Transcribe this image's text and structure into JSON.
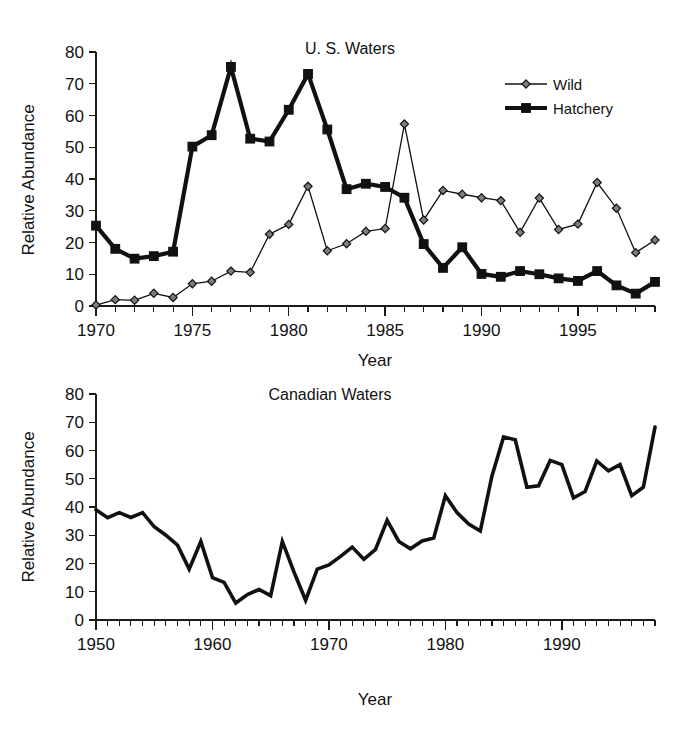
{
  "figure": {
    "panels": [
      "us-waters",
      "canadian-waters"
    ]
  },
  "chart_data": [
    {
      "id": "us-waters",
      "type": "line",
      "title": "U. S. Waters",
      "xlabel": "Year",
      "ylabel": "Relative Abundance",
      "xlim": [
        1970,
        1999
      ],
      "ylim": [
        0,
        80
      ],
      "yticks": [
        0,
        10,
        20,
        30,
        40,
        50,
        60,
        70,
        80
      ],
      "ytick_labels": [
        "0",
        "10",
        "20",
        "30",
        "40",
        "50",
        "60",
        "70",
        "80"
      ],
      "xticks": [
        1970,
        1975,
        1980,
        1985,
        1990,
        1995
      ],
      "xtick_labels": [
        "1970",
        "1975",
        "1980",
        "1985",
        "1990",
        "1995"
      ],
      "xtick_minor_step": 1,
      "grid": false,
      "legend_position": "top-right",
      "x": [
        1970,
        1971,
        1972,
        1973,
        1974,
        1975,
        1976,
        1977,
        1978,
        1979,
        1980,
        1981,
        1982,
        1983,
        1984,
        1985,
        1986,
        1987,
        1988,
        1989,
        1990,
        1991,
        1992,
        1993,
        1994,
        1995,
        1996,
        1997,
        1998,
        1999
      ],
      "series": [
        {
          "name": "Wild",
          "marker": "diamond",
          "color": "#111111",
          "values": [
            0.3,
            2.0,
            1.8,
            4.0,
            2.7,
            7.0,
            7.8,
            11.0,
            10.6,
            22.6,
            25.7,
            37.7,
            17.4,
            19.6,
            23.5,
            24.4,
            57.3,
            27.1,
            36.4,
            35.2,
            34.1,
            33.2,
            23.2,
            34.0,
            24.1,
            25.8,
            38.9,
            30.8,
            16.8,
            20.8
          ]
        },
        {
          "name": "Hatchery",
          "marker": "square",
          "color": "#111111",
          "values": [
            25.3,
            18.0,
            14.9,
            15.7,
            17.1,
            50.2,
            53.8,
            75.3,
            52.7,
            51.8,
            61.8,
            73.1,
            55.6,
            36.8,
            38.5,
            37.5,
            34.1,
            19.5,
            12.0,
            18.5,
            10.1,
            9.2,
            11.0,
            10.0,
            8.7,
            7.9,
            11.0,
            6.5,
            3.9,
            7.6
          ]
        }
      ]
    },
    {
      "id": "canadian-waters",
      "type": "line",
      "title": "Canadian Waters",
      "xlabel": "Year",
      "ylabel": "Relative Abundance",
      "xlim": [
        1950,
        1998
      ],
      "ylim": [
        0,
        80
      ],
      "yticks": [
        0,
        10,
        20,
        30,
        40,
        50,
        60,
        70,
        80
      ],
      "ytick_labels": [
        "0",
        "10",
        "20",
        "30",
        "40",
        "50",
        "60",
        "70",
        "80"
      ],
      "xticks": [
        1950,
        1960,
        1970,
        1980,
        1990
      ],
      "xtick_labels": [
        "1950",
        "1960",
        "1970",
        "1980",
        "1990"
      ],
      "xtick_minor_step": 1,
      "grid": false,
      "legend_position": "none",
      "x": [
        1950,
        1951,
        1952,
        1953,
        1954,
        1955,
        1956,
        1957,
        1958,
        1959,
        1960,
        1961,
        1962,
        1963,
        1964,
        1965,
        1966,
        1967,
        1968,
        1969,
        1970,
        1971,
        1972,
        1973,
        1974,
        1975,
        1976,
        1977,
        1978,
        1979,
        1980,
        1981,
        1982,
        1983,
        1984,
        1985,
        1986,
        1987,
        1988,
        1989,
        1990,
        1991,
        1992,
        1993,
        1994,
        1995,
        1996,
        1997,
        1998
      ],
      "series": [
        {
          "name": "Canadian Waters",
          "marker": "none",
          "color": "#111111",
          "values": [
            39.0,
            36.2,
            38.0,
            36.3,
            38.0,
            33.0,
            30.0,
            26.5,
            18.0,
            27.8,
            15.0,
            13.3,
            6.0,
            9.0,
            10.8,
            8.6,
            27.8,
            17.0,
            7.0,
            18.0,
            19.5,
            22.5,
            25.8,
            21.5,
            25.0,
            35.3,
            27.8,
            25.2,
            28.0,
            29.0,
            44.0,
            38.0,
            34.0,
            31.5,
            51.0,
            64.8,
            63.8,
            47.0,
            47.5,
            56.5,
            55.0,
            43.2,
            45.5,
            56.3,
            52.8,
            55.0,
            44.0,
            47.0,
            68.3
          ]
        }
      ]
    }
  ]
}
